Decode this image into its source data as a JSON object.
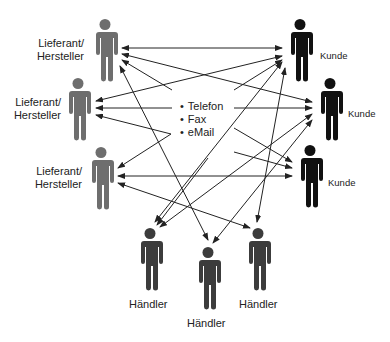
{
  "colors": {
    "supplier": "#6e6e6e",
    "customer": "#111111",
    "dealer": "#3c3c3c",
    "arrow": "#222222"
  },
  "channels": [
    "Telefon",
    "Fax",
    "eMail"
  ],
  "suppliers": [
    {
      "label_line1": "Lieferant/",
      "label_line2": "Hersteller"
    },
    {
      "label_line1": "Lieferant/",
      "label_line2": "Hersteller"
    },
    {
      "label_line1": "Lieferant/",
      "label_line2": "Hersteller"
    }
  ],
  "customers": [
    {
      "label": "Kunde"
    },
    {
      "label": "Kunde"
    },
    {
      "label": "Kunde"
    }
  ],
  "dealers": [
    {
      "label": "Händler"
    },
    {
      "label": "Händler"
    },
    {
      "label": "Händler"
    }
  ]
}
